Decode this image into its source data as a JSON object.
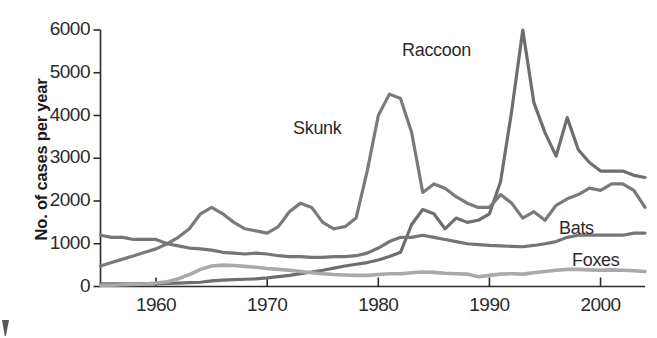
{
  "axes": {
    "y_label": "No. of cases per year",
    "y_ticks": [
      "0",
      "1000",
      "2000",
      "3000",
      "4000",
      "5000",
      "6000"
    ],
    "x_ticks": [
      "1960",
      "1970",
      "1980",
      "1990",
      "2000"
    ]
  },
  "series_labels": {
    "raccoon": "Raccoon",
    "skunk": "Skunk",
    "bats": "Bats",
    "foxes": "Foxes"
  },
  "colors": {
    "raccoon": "#6e6e6e",
    "skunk": "#7a7a7a",
    "bats": "#757575",
    "foxes": "#a9a9a9",
    "axis": "#2b2b2b",
    "text": "#2b2b2b"
  },
  "chart_data": {
    "type": "line",
    "title": "",
    "xlabel": "",
    "ylabel": "No. of cases per year",
    "xlim": [
      1955,
      2004
    ],
    "ylim": [
      0,
      6000
    ],
    "grid": false,
    "legend": "inline-labels",
    "x": [
      1955,
      1956,
      1957,
      1958,
      1959,
      1960,
      1961,
      1962,
      1963,
      1964,
      1965,
      1966,
      1967,
      1968,
      1969,
      1970,
      1971,
      1972,
      1973,
      1974,
      1975,
      1976,
      1977,
      1978,
      1979,
      1980,
      1981,
      1982,
      1983,
      1984,
      1985,
      1986,
      1987,
      1988,
      1989,
      1990,
      1991,
      1992,
      1993,
      1994,
      1995,
      1996,
      1997,
      1998,
      1999,
      2000,
      2001,
      2002,
      2003,
      2004
    ],
    "series": [
      {
        "name": "Raccoon",
        "color": "#6e6e6e",
        "values": [
          60,
          60,
          60,
          60,
          60,
          60,
          70,
          80,
          90,
          100,
          130,
          150,
          160,
          170,
          180,
          200,
          230,
          260,
          300,
          340,
          380,
          430,
          480,
          520,
          560,
          620,
          700,
          800,
          1450,
          1800,
          1700,
          1350,
          1600,
          1500,
          1550,
          1700,
          2450,
          4100,
          6000,
          4300,
          3600,
          3050,
          3950,
          3200,
          2900,
          2700,
          2700,
          2700,
          2600,
          2550
        ]
      },
      {
        "name": "Skunk",
        "color": "#7a7a7a",
        "values": [
          480,
          560,
          640,
          720,
          800,
          880,
          1000,
          1150,
          1350,
          1700,
          1850,
          1700,
          1500,
          1350,
          1300,
          1250,
          1400,
          1750,
          1950,
          1850,
          1500,
          1350,
          1400,
          1600,
          2700,
          4000,
          4500,
          4400,
          3600,
          2200,
          2400,
          2300,
          2100,
          1950,
          1850,
          1850,
          2150,
          1950,
          1600,
          1750,
          1550,
          1900,
          2050,
          2150,
          2300,
          2250,
          2400,
          2400,
          2250,
          1850
        ]
      },
      {
        "name": "Bats",
        "color": "#757575",
        "values": [
          1200,
          1150,
          1150,
          1100,
          1100,
          1100,
          1000,
          950,
          900,
          880,
          850,
          800,
          780,
          760,
          780,
          760,
          720,
          700,
          700,
          680,
          680,
          700,
          700,
          720,
          780,
          900,
          1050,
          1150,
          1150,
          1200,
          1150,
          1100,
          1050,
          1000,
          980,
          960,
          950,
          940,
          930,
          960,
          1000,
          1050,
          1150,
          1200,
          1200,
          1200,
          1200,
          1200,
          1250,
          1250
        ]
      },
      {
        "name": "Foxes",
        "color": "#a9a9a9",
        "values": [
          30,
          30,
          40,
          50,
          60,
          80,
          110,
          180,
          280,
          400,
          480,
          500,
          490,
          470,
          450,
          420,
          400,
          380,
          350,
          320,
          300,
          280,
          270,
          260,
          260,
          280,
          300,
          300,
          320,
          340,
          330,
          310,
          300,
          290,
          230,
          260,
          290,
          300,
          290,
          320,
          350,
          380,
          400,
          400,
          390,
          380,
          390,
          380,
          370,
          350
        ]
      }
    ]
  }
}
